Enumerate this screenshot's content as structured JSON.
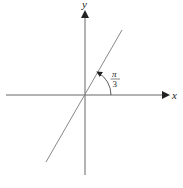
{
  "diagram": {
    "axes": {
      "x_label": "x",
      "y_label": "y"
    },
    "line": {
      "description": "line through origin",
      "angle_with_x_axis": "π/3"
    },
    "angle_label": {
      "numerator": "π",
      "denominator": "3"
    },
    "colors": {
      "axis": "#555555",
      "line": "#777777",
      "text": "#222222"
    },
    "footer_fragment": "π"
  }
}
